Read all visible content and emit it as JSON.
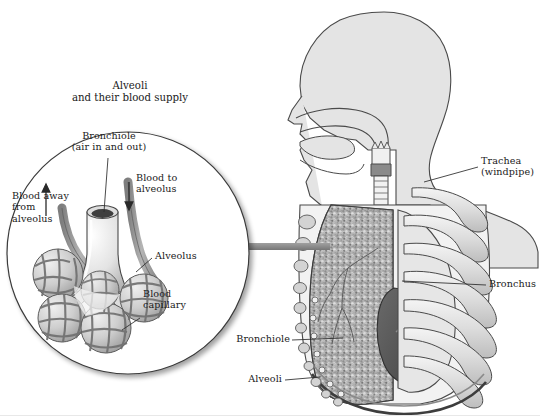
{
  "figure": {
    "kind": "anatomical-illustration",
    "background_color": "#ffffff",
    "ink_color": "#1a1a1a"
  },
  "inset": {
    "title": "Alveoli\nand their blood supply",
    "shape": "circle",
    "labels": {
      "bronchiole": "Bronchiole\n(air in and out)",
      "blood_to": "Blood to\nalveolus",
      "blood_away": "Blood away\nfrom\nalveolus",
      "alveolus": "Alveolus",
      "capillary": "Blood\ncapillary"
    },
    "arrows": {
      "blood_to_direction": "down",
      "blood_away_direction": "up"
    }
  },
  "body": {
    "labels": {
      "trachea": "Trachea\n(windpipe)",
      "bronchus": "Bronchus",
      "bronchiole": "Bronchiole",
      "alveoli": "Alveoli"
    }
  },
  "colors": {
    "outline": "#3d3d3d",
    "skin_fill": "#e4e4e4",
    "lung_fill": "#b9b9b9",
    "rib_fill": "#dedede",
    "heart_fill": "#595959",
    "connector_bar": "#8c8c8c",
    "vessel_fill": "#9a9a9a",
    "alveoli_fill": "#c9c9c9"
  }
}
